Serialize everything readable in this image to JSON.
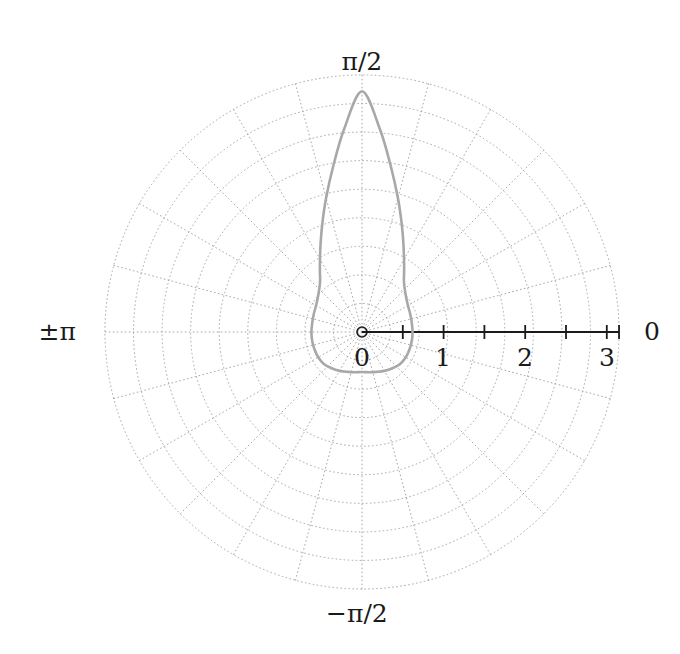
{
  "figure": {
    "background_color": "#ffffff",
    "width": 680,
    "height": 654
  },
  "angular_labels": {
    "top": "π/2",
    "left": "±π",
    "right": "0",
    "bottom": "−π/2"
  },
  "radial_tick_labels": {
    "t0": "0",
    "t1": "1",
    "t2": "2",
    "t3": "3"
  },
  "chart_data": {
    "type": "line",
    "subtype": "polar",
    "title": "",
    "xlabel": "",
    "ylabel": "",
    "theta_unit": "radians",
    "theta_zero_location": "E",
    "theta_direction": "counterclockwise",
    "grid": true,
    "grid_style": "dotted",
    "grid_color": "#999999",
    "legend": false,
    "rlim": [
      0,
      3.15
    ],
    "r_ticks": [
      0,
      0.5,
      1.0,
      1.5,
      2.0,
      2.5,
      3.0
    ],
    "r_tick_labels": [
      "0",
      "",
      "1",
      "",
      "2",
      "",
      "3"
    ],
    "r_grid_circles": [
      0.35,
      0.7,
      1.05,
      1.4,
      1.75,
      2.1,
      2.45,
      2.8,
      3.15
    ],
    "theta_grid_degrees": [
      0,
      15,
      30,
      45,
      60,
      75,
      90,
      105,
      120,
      135,
      150,
      165,
      180,
      195,
      210,
      225,
      240,
      255,
      270,
      285,
      300,
      315,
      330,
      345
    ],
    "theta_tick_labels": [
      "0",
      "π/2",
      "±π",
      "−π/2"
    ],
    "axis_line_color": "#1a1a1a",
    "series": [
      {
        "name": "curve",
        "color": "#a8a8a8",
        "line_width": 2.6,
        "description": "closed loop, apex r=2.95 at theta=pi/2, half-width 0.61, dips to r=0.49 at theta=-pi/2",
        "r_max": 2.95,
        "half_width": 0.61,
        "r_bottom": 0.49,
        "theta": [
          -90,
          -80,
          -70,
          -60,
          -50,
          -40,
          -30,
          -20,
          -10,
          0,
          10,
          20,
          30,
          40,
          50,
          55,
          60,
          65,
          70,
          75,
          80,
          85,
          90,
          95,
          100,
          105,
          110,
          115,
          120,
          125,
          130,
          140,
          150,
          160,
          170,
          180,
          190,
          200,
          210,
          220,
          230,
          240,
          250,
          260,
          270
        ],
        "r": [
          0.49,
          0.5,
          0.52,
          0.55,
          0.58,
          0.61,
          0.62,
          0.62,
          0.62,
          0.62,
          0.62,
          0.63,
          0.65,
          0.7,
          0.8,
          0.9,
          1.03,
          1.2,
          1.42,
          1.7,
          2.05,
          2.5,
          2.95,
          2.5,
          2.05,
          1.7,
          1.42,
          1.2,
          1.03,
          0.9,
          0.8,
          0.7,
          0.65,
          0.63,
          0.62,
          0.62,
          0.62,
          0.62,
          0.62,
          0.61,
          0.58,
          0.55,
          0.52,
          0.5,
          0.49
        ]
      }
    ]
  }
}
